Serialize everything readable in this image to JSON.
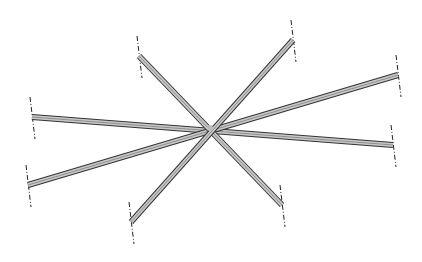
{
  "diagram": {
    "background": "#ffffff",
    "beam_fill": "#c8c8c8",
    "beam_edge": "#333333",
    "centerline_color": "#222222",
    "hub": {
      "x": 210,
      "y": 128
    },
    "beams": [
      {
        "id": "beam-a",
        "x1": 32,
        "y1": 117,
        "x2": 393,
        "y2": 145
      },
      {
        "id": "beam-b",
        "x1": 28,
        "y1": 185,
        "x2": 398,
        "y2": 75
      },
      {
        "id": "beam-c",
        "x1": 139,
        "y1": 56,
        "x2": 282,
        "y2": 205
      },
      {
        "id": "beam-d",
        "x1": 131,
        "y1": 222,
        "x2": 293,
        "y2": 40
      }
    ],
    "centerlines": [
      {
        "x": 32,
        "y": 117
      },
      {
        "x": 393,
        "y": 145
      },
      {
        "x": 28,
        "y": 185
      },
      {
        "x": 398,
        "y": 75
      },
      {
        "x": 139,
        "y": 56
      },
      {
        "x": 282,
        "y": 205
      },
      {
        "x": 131,
        "y": 222
      },
      {
        "x": 293,
        "y": 40
      }
    ]
  }
}
